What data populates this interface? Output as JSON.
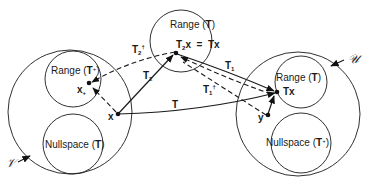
{
  "diagram": {
    "type": "linear-operator-space-mapping",
    "spaces": {
      "domain_space": {
        "label": "𝒱"
      },
      "codomain_space": {
        "label": "𝒰"
      }
    },
    "regions": {
      "left_range": {
        "label": "Range (T⁺)",
        "prefix": "Range (",
        "op": "T",
        "sup": "+",
        "suffix": ")"
      },
      "left_nullspace": {
        "label": "Nullspace (T)",
        "prefix": "Nullspace (",
        "op": "T",
        "suffix": ")"
      },
      "middle_range": {
        "label": "Range (T)",
        "prefix": "Range (",
        "op": "T",
        "suffix": ")"
      },
      "right_range": {
        "label": "Range (T)",
        "prefix": "Range (",
        "op": "T",
        "suffix": ")"
      },
      "right_nullspace": {
        "label": "Nullspace (T⁺)",
        "prefix": "Nullspace (",
        "op": "T",
        "sup": "+",
        "suffix": ")"
      }
    },
    "points": {
      "x": {
        "label": "x"
      },
      "x_plus": {
        "label": "x",
        "sub": "+"
      },
      "t2x": {
        "label": "T₂x = Tx",
        "main": "T",
        "sub": "2",
        "rest": "x  =  Tx"
      },
      "tx": {
        "label": "Tx"
      },
      "y": {
        "label": "y"
      }
    },
    "arrows": {
      "T": {
        "label": "T",
        "style": "solid"
      },
      "T1": {
        "label": "T₁",
        "main": "T",
        "sub": "1",
        "style": "solid"
      },
      "T2": {
        "label": "T₂",
        "main": "T",
        "sub": "2",
        "style": "solid"
      },
      "T1_dagger": {
        "label": "T₁†",
        "main": "T",
        "sub": "1",
        "sup": "†",
        "style": "dashed"
      },
      "T2_dagger": {
        "label": "T₂†",
        "main": "T",
        "sub": "2",
        "sup": "†",
        "style": "dashed"
      }
    }
  }
}
